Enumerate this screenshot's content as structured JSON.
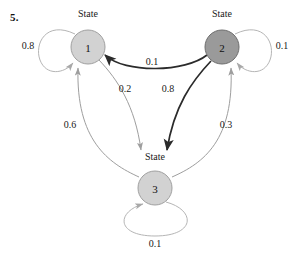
{
  "problem": {
    "number": "5."
  },
  "diagram": {
    "type": "state-transition-diagram",
    "caption_word": "State",
    "nodes": [
      {
        "id": "1",
        "label": "1",
        "caption": "State",
        "cx": 88,
        "cy": 47,
        "r": 17,
        "fill": "#d2d2d2",
        "stroke": "#a0a0a0",
        "caption_x": 88,
        "caption_y": 14
      },
      {
        "id": "2",
        "label": "2",
        "caption": "State",
        "cx": 222,
        "cy": 47,
        "r": 17,
        "fill": "#9a9a9a",
        "stroke": "#6e6e6e",
        "caption_x": 222,
        "caption_y": 14
      },
      {
        "id": "3",
        "label": "3",
        "caption": "State",
        "cx": 155,
        "cy": 188,
        "r": 17,
        "fill": "#d2d2d2",
        "stroke": "#a0a0a0",
        "caption_x": 155,
        "caption_y": 157
      }
    ],
    "edges": [
      {
        "from": "1",
        "to": "1",
        "weight": "0.8",
        "kind": "self-loop",
        "label_x": 28,
        "label_y": 45,
        "color": "#b5b5b5",
        "width": 1.0
      },
      {
        "from": "2",
        "to": "2",
        "weight": "0.1",
        "kind": "self-loop",
        "label_x": 282,
        "label_y": 45,
        "color": "#b5b5b5",
        "width": 1.0
      },
      {
        "from": "3",
        "to": "3",
        "weight": "0.1",
        "kind": "self-loop",
        "label_x": 155,
        "label_y": 243,
        "color": "#b5b5b5",
        "width": 1.0
      },
      {
        "from": "2",
        "to": "1",
        "weight": "0.1",
        "kind": "curve",
        "label_x": 152,
        "label_y": 61,
        "color": "#2b2b2b",
        "width": 1.7
      },
      {
        "from": "1",
        "to": "3",
        "weight": "0.2",
        "kind": "curve",
        "label_x": 125,
        "label_y": 88,
        "color": "#9e9e9e",
        "width": 1.0
      },
      {
        "from": "2",
        "to": "3",
        "weight": "0.8",
        "kind": "curve",
        "label_x": 168,
        "label_y": 88,
        "color": "#2b2b2b",
        "width": 1.7
      },
      {
        "from": "3",
        "to": "1",
        "weight": "0.6",
        "kind": "curve",
        "label_x": 70,
        "label_y": 124,
        "color": "#9e9e9e",
        "width": 1.0
      },
      {
        "from": "3",
        "to": "2",
        "weight": "0.3",
        "kind": "curve",
        "label_x": 226,
        "label_y": 124,
        "color": "#9e9e9e",
        "width": 1.0
      }
    ]
  }
}
